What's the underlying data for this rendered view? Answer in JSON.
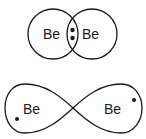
{
  "diagram": {
    "top": {
      "left_atom": "Be",
      "right_atom": "Be",
      "shared_electrons": 2
    },
    "bottom": {
      "left_atom": "Be",
      "right_atom": "Be",
      "electrons": 2
    },
    "colors": {
      "stroke": "#1a1a1a",
      "background": "#ffffff"
    }
  }
}
